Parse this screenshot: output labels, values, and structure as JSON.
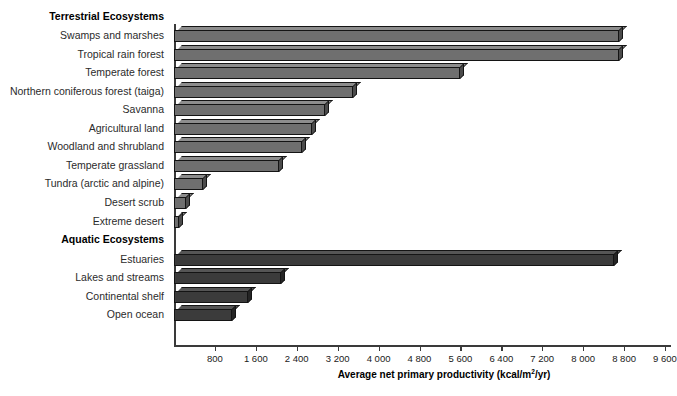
{
  "chart_data": {
    "type": "bar",
    "orientation": "horizontal",
    "title": "",
    "xlabel": "Average net primary productivity (kcal/m2/yr)",
    "xlabel_parts": {
      "before": "Average net primary productivity (kcal/m",
      "sup": "2",
      "after": "/yr)"
    },
    "ylabel": "",
    "xlim": [
      0,
      9600
    ],
    "xticks": [
      800,
      1600,
      2400,
      3200,
      4000,
      4800,
      5600,
      6400,
      7200,
      8000,
      8800,
      9600
    ],
    "xtick_labels": [
      "800",
      "1 600",
      "2 400",
      "3 200",
      "4 000",
      "4 800",
      "5 600",
      "6 400",
      "7 200",
      "8 000",
      "8 800",
      "9 600"
    ],
    "grid": false,
    "legend": "none",
    "groups": [
      {
        "name": "Terrestrial Ecosystems",
        "color": "#6f6f6f",
        "categories": [
          "Swamps and marshes",
          "Tropical rain forest",
          "Temperate forest",
          "Northern coniferous forest (taiga)",
          "Savanna",
          "Agricultural land",
          "Woodland and shrubland",
          "Temperate grassland",
          "Tundra (arctic and alpine)",
          "Desert scrub",
          "Extreme desert"
        ],
        "values": [
          8700,
          8700,
          5600,
          3500,
          2950,
          2700,
          2500,
          2050,
          570,
          230,
          100
        ]
      },
      {
        "name": "Aquatic Ecosystems",
        "color": "#3b3b3b",
        "categories": [
          "Estuaries",
          "Lakes and streams",
          "Continental shelf",
          "Open ocean"
        ],
        "values": [
          8600,
          2100,
          1450,
          1130
        ]
      }
    ]
  },
  "axis": {
    "tick_labels": [
      "800",
      "1 600",
      "2 400",
      "3 200",
      "4 000",
      "4 800",
      "5 600",
      "6 400",
      "7 200",
      "8 000",
      "8 800",
      "9 600"
    ],
    "title_before": "Average net primary productivity (kcal/m",
    "title_sup": "2",
    "title_after": "/yr)"
  },
  "colors": {
    "terrestrial_front": "#6f6f6f",
    "terrestrial_top": "#8d8d8d",
    "terrestrial_side": "#4b4b4b",
    "aquatic_front": "#3b3b3b",
    "aquatic_top": "#555555",
    "aquatic_side": "#252525",
    "axis": "#3a3a3a",
    "text": "#1a1a1a",
    "background": "#ffffff"
  }
}
